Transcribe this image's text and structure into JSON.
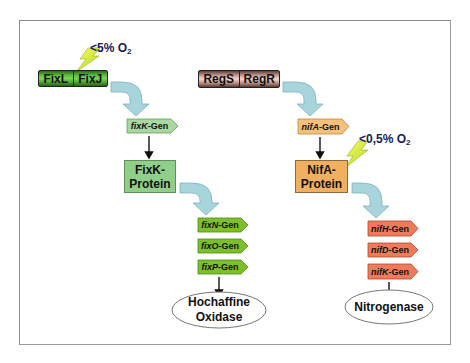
{
  "diagram": {
    "left_pathway": {
      "sensor_pair": [
        "FixL",
        "FixJ"
      ],
      "oxygen_condition": {
        "prefix": "<5% O",
        "subscript": "2"
      },
      "regulator_gene": {
        "italic": "fixK",
        "suffix": "-Gen"
      },
      "regulator_protein": [
        "FixK-",
        "Protein"
      ],
      "target_genes": [
        {
          "italic": "fixN",
          "suffix": "-Gen"
        },
        {
          "italic": "fixO",
          "suffix": "-Gen"
        },
        {
          "italic": "fixP",
          "suffix": "-Gen"
        }
      ],
      "product": [
        "Hochaffine",
        "Oxidase"
      ]
    },
    "right_pathway": {
      "sensor_pair": [
        "RegS",
        "RegR"
      ],
      "oxygen_condition": {
        "prefix": "<0,5% O",
        "subscript": "2"
      },
      "regulator_gene": {
        "italic": "nifA",
        "suffix": "-Gen"
      },
      "regulator_protein": [
        "NifA-",
        "Protein"
      ],
      "target_genes": [
        {
          "italic": "nifH",
          "suffix": "-Gen"
        },
        {
          "italic": "nifD",
          "suffix": "-Gen"
        },
        {
          "italic": "nifK",
          "suffix": "-Gen"
        }
      ],
      "product": [
        "Nitrogenase"
      ]
    },
    "colors": {
      "fix_bar": "#5fbf3e",
      "reg_bar": "#c9a299",
      "fixK_gene": "#a8d8a0",
      "fixK_protein": "#8fcf8a",
      "nifA_gene": "#f5c07a",
      "nifA_protein": "#f0b060",
      "fix_target_genes": "#7cbf2a",
      "nif_target_genes": "#f07a5a",
      "curved_arrow": "#a8d4dc",
      "lightning": "#d8ee3a",
      "oxygen_text": "#1a1a5e"
    }
  }
}
